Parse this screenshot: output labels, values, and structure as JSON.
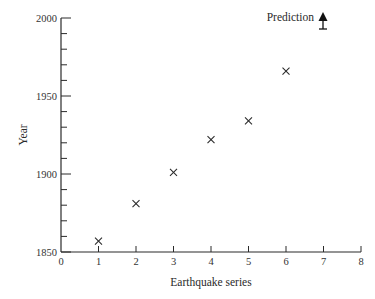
{
  "chart_data": {
    "type": "scatter",
    "title": "",
    "xlabel": "Earthquake series",
    "ylabel": "Year",
    "xlim": [
      0,
      8
    ],
    "ylim": [
      1850,
      2000
    ],
    "x_ticks": [
      0,
      1,
      2,
      3,
      4,
      5,
      6,
      7,
      8
    ],
    "y_ticks": [
      1850,
      1900,
      1950,
      2000
    ],
    "y_minor_tick_step": 10,
    "grid": false,
    "marker": "x",
    "series": [
      {
        "name": "Earthquakes",
        "x": [
          1,
          2,
          3,
          4,
          5,
          6
        ],
        "values": [
          1857,
          1881,
          1901,
          1922,
          1934,
          1966
        ]
      }
    ],
    "annotations": [
      {
        "label": "Prediction",
        "x": 7,
        "marker": "filled-up-arrow-above-bar",
        "position": "top of plot (off-scale high)"
      }
    ],
    "colors": {
      "ink": "#2a2a2a",
      "background": "#ffffff"
    }
  }
}
